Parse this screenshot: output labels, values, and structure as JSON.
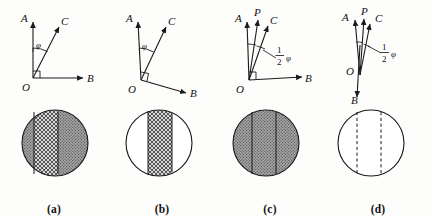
{
  "figure": {
    "background_color": "#fdfdfc",
    "ink_color": "#1a1a1a"
  },
  "panels": [
    {
      "id": "a",
      "caption": "(a)",
      "vector_labels": {
        "a": "A",
        "b": "B",
        "c": "C",
        "angle": "φ"
      },
      "has_p_vector": false,
      "angle_label_kind": "phi",
      "b_direction": "right-horizontal",
      "right_angle_marker": true,
      "circle": {
        "fill_style": "stippled",
        "fill_color": "#9a9a9a",
        "band_style": "crosshatched",
        "band_fill_color": "#cfcfcf",
        "band_line_style": "solid",
        "band_left_fraction": 0.32,
        "band_right_fraction": 0.68
      }
    },
    {
      "id": "b",
      "caption": "(b)",
      "vector_labels": {
        "a": "A",
        "b": "B",
        "c": "C",
        "angle": "φ"
      },
      "has_p_vector": false,
      "angle_label_kind": "phi",
      "b_direction": "down-right",
      "right_angle_marker": true,
      "circle": {
        "fill_style": "white",
        "fill_color": "#ffffff",
        "band_style": "crosshatched",
        "band_fill_color": "#cfcfcf",
        "band_line_style": "solid",
        "band_left_fraction": 0.32,
        "band_right_fraction": 0.68
      }
    },
    {
      "id": "c",
      "caption": "(c)",
      "vector_labels": {
        "a": "A",
        "b": "B",
        "c": "C",
        "p": "P",
        "angle_numerator": "1",
        "angle_denominator": "2",
        "angle": "φ"
      },
      "has_p_vector": true,
      "angle_label_kind": "half-phi",
      "b_direction": "right-horizontal",
      "right_angle_marker": true,
      "circle": {
        "fill_style": "stippled",
        "fill_color": "#9a9a9a",
        "band_style": "stippled",
        "band_fill_color": "#9a9a9a",
        "band_line_style": "solid",
        "band_left_fraction": 0.3,
        "band_right_fraction": 0.66
      }
    },
    {
      "id": "d",
      "caption": "(d)",
      "vector_labels": {
        "a": "A",
        "b": "B",
        "c": "C",
        "p": "P",
        "angle_numerator": "1",
        "angle_denominator": "2",
        "angle": "φ"
      },
      "has_p_vector": true,
      "angle_label_kind": "half-phi",
      "b_direction": "straight-down",
      "right_angle_marker": false,
      "circle": {
        "fill_style": "white",
        "fill_color": "#ffffff",
        "band_style": "none",
        "band_fill_color": "#ffffff",
        "band_line_style": "dashed",
        "band_left_fraction": 0.3,
        "band_right_fraction": 0.68
      }
    }
  ]
}
